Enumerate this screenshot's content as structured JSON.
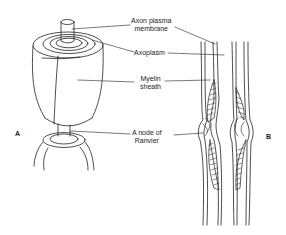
{
  "diagram": {
    "panels": [
      {
        "id": "A",
        "label": "A",
        "description": "3D cut-away of myelinated axon with node of Ranvier"
      },
      {
        "id": "B",
        "label": "B",
        "description": "Longitudinal section showing node of Ranvier"
      }
    ],
    "labels": {
      "axon_plasma_membrane_line1": "Axon plasma",
      "axon_plasma_membrane_line2": "membrane",
      "axoplasm": "Axoplasm",
      "myelin_sheath_line1": "Myelin",
      "myelin_sheath_line2": "sheath",
      "node_of_ranvier_line1": "A node of",
      "node_of_ranvier_line2": "Ranvier"
    },
    "colors": {
      "stroke": "#222222",
      "background": "#ffffff",
      "text": "#222222"
    }
  }
}
